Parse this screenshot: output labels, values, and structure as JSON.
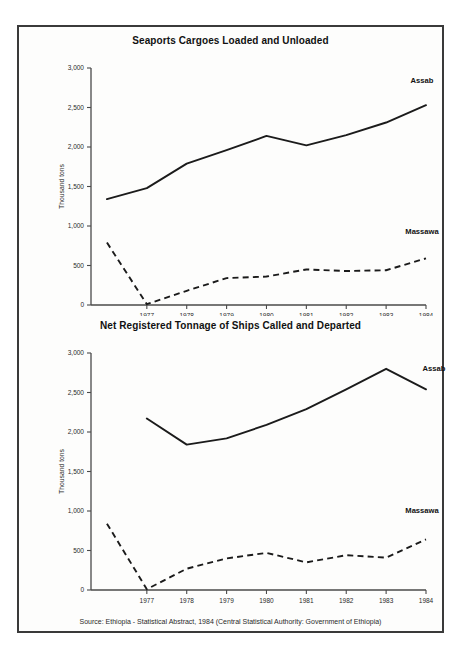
{
  "figure": {
    "source_note": "Source: Ethiopia - Statistical Abstract, 1984 (Central Statistical Authority: Government of Ethiopia)",
    "border_color": "#3a3a3a",
    "background_color": "#fdfdfc",
    "line_color": "#1b1b1b"
  },
  "chart_data": [
    {
      "type": "line",
      "title": "Seaports Cargoes Loaded and Unloaded",
      "xlabel": "Year",
      "ylabel": "Thousand tons",
      "x": [
        1976,
        1977,
        1978,
        1979,
        1980,
        1981,
        1982,
        1983,
        1984
      ],
      "xlim": [
        1975.6,
        1984
      ],
      "ylim": [
        0,
        3000
      ],
      "ytick_labels": [
        "0",
        "500",
        "1,000",
        "1,500",
        "2,000",
        "2,500",
        "3,000"
      ],
      "ytick_values": [
        0,
        500,
        1000,
        1500,
        2000,
        2500,
        3000
      ],
      "xtick_labels": [
        "1977",
        "1978",
        "1979",
        "1980",
        "1981",
        "1982",
        "1983",
        "1984"
      ],
      "xtick_values": [
        1977,
        1978,
        1979,
        1980,
        1981,
        1982,
        1983,
        1984
      ],
      "grid": false,
      "legend_position": "inline-end-labels",
      "series": [
        {
          "name": "Assab",
          "style": "solid",
          "x": [
            1976,
            1977,
            1978,
            1979,
            1980,
            1981,
            1982,
            1983,
            1984
          ],
          "values": [
            1340,
            1480,
            1790,
            1960,
            2140,
            2020,
            2150,
            2310,
            2530
          ]
        },
        {
          "name": "Massawa",
          "style": "dashed",
          "x": [
            1976,
            1977,
            1978,
            1979,
            1980,
            1981,
            1982,
            1983,
            1984
          ],
          "values": [
            790,
            10,
            180,
            340,
            360,
            450,
            430,
            440,
            590
          ]
        }
      ]
    },
    {
      "type": "line",
      "title": "Net Registered Tonnage of Ships Called and Departed",
      "xlabel": "Year",
      "ylabel": "Thousand tons",
      "x": [
        1976,
        1977,
        1978,
        1979,
        1980,
        1981,
        1982,
        1983,
        1984
      ],
      "xlim": [
        1975.6,
        1984
      ],
      "ylim": [
        0,
        3000
      ],
      "ytick_labels": [
        "0",
        "500",
        "1,000",
        "1,500",
        "2,000",
        "2,500",
        "3,000"
      ],
      "ytick_values": [
        0,
        500,
        1000,
        1500,
        2000,
        2500,
        3000
      ],
      "xtick_labels": [
        "1977",
        "1978",
        "1979",
        "1980",
        "1981",
        "1982",
        "1983",
        "1984"
      ],
      "xtick_values": [
        1977,
        1978,
        1979,
        1980,
        1981,
        1982,
        1983,
        1984
      ],
      "grid": false,
      "legend_position": "inline-end-labels",
      "series": [
        {
          "name": "Assab",
          "style": "solid",
          "x": [
            1977,
            1978,
            1979,
            1980,
            1981,
            1982,
            1983,
            1984
          ],
          "values": [
            2170,
            1840,
            1920,
            2090,
            2290,
            2540,
            2800,
            2540
          ]
        },
        {
          "name": "Massawa",
          "style": "dashed",
          "x": [
            1976,
            1977,
            1978,
            1979,
            1980,
            1981,
            1982,
            1983,
            1984
          ],
          "values": [
            840,
            10,
            270,
            400,
            470,
            350,
            440,
            410,
            640
          ]
        }
      ]
    }
  ]
}
